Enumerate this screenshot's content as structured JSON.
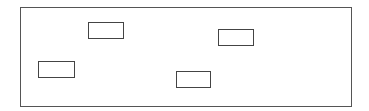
{
  "diagram": {
    "frame": {
      "x": 20,
      "y": 7,
      "w": 332,
      "h": 100,
      "stroke": "#555555"
    },
    "boxes": [
      {
        "id": "box-1",
        "x": 88,
        "y": 22,
        "w": 36,
        "h": 17,
        "stroke": "#444444",
        "label": ""
      },
      {
        "id": "box-2",
        "x": 218,
        "y": 29,
        "w": 36,
        "h": 17,
        "stroke": "#444444",
        "label": ""
      },
      {
        "id": "box-3",
        "x": 38,
        "y": 61,
        "w": 37,
        "h": 17,
        "stroke": "#444444",
        "label": ""
      },
      {
        "id": "box-4",
        "x": 176,
        "y": 71,
        "w": 35,
        "h": 17,
        "stroke": "#444444",
        "label": ""
      }
    ]
  }
}
